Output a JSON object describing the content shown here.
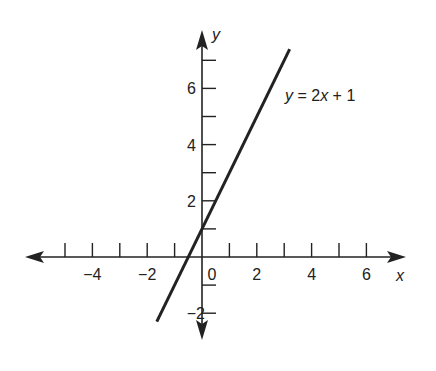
{
  "chart_data": {
    "type": "line",
    "title": "",
    "xlabel": "x",
    "ylabel": "y",
    "xlim": [
      -6.5,
      7.5
    ],
    "ylim": [
      -2.9,
      7.7
    ],
    "x_ticks": [
      -5,
      -4,
      -3,
      -2,
      -1,
      0,
      1,
      2,
      3,
      4,
      5,
      6
    ],
    "x_tick_labels": [
      {
        "value": -4,
        "label": "−4"
      },
      {
        "value": -2,
        "label": "−2"
      },
      {
        "value": 0,
        "label": "0"
      },
      {
        "value": 2,
        "label": "2"
      },
      {
        "value": 4,
        "label": "4"
      },
      {
        "value": 6,
        "label": "6"
      }
    ],
    "y_ticks": [
      -2,
      -1,
      1,
      2,
      3,
      4,
      5,
      6,
      7
    ],
    "y_tick_labels": [
      {
        "value": -2,
        "label": "−2"
      },
      {
        "value": 2,
        "label": "2"
      },
      {
        "value": 4,
        "label": "4"
      },
      {
        "value": 6,
        "label": "6"
      }
    ],
    "grid": false,
    "series": [
      {
        "name": "y = 2x + 1",
        "equation": "y = 2x + 1",
        "slope": 2,
        "intercept": 1,
        "x": [
          -1.65,
          3.2
        ],
        "y": [
          -2.3,
          7.4
        ]
      }
    ],
    "annotations": [
      {
        "text": "y = 2x + 1",
        "x": 3.5,
        "y": 5.5
      }
    ]
  },
  "labels": {
    "x_axis": "x",
    "y_axis": "y",
    "equation_y": "y",
    "equation_eq": " = 2",
    "equation_x": "x",
    "equation_rest": " + 1"
  }
}
